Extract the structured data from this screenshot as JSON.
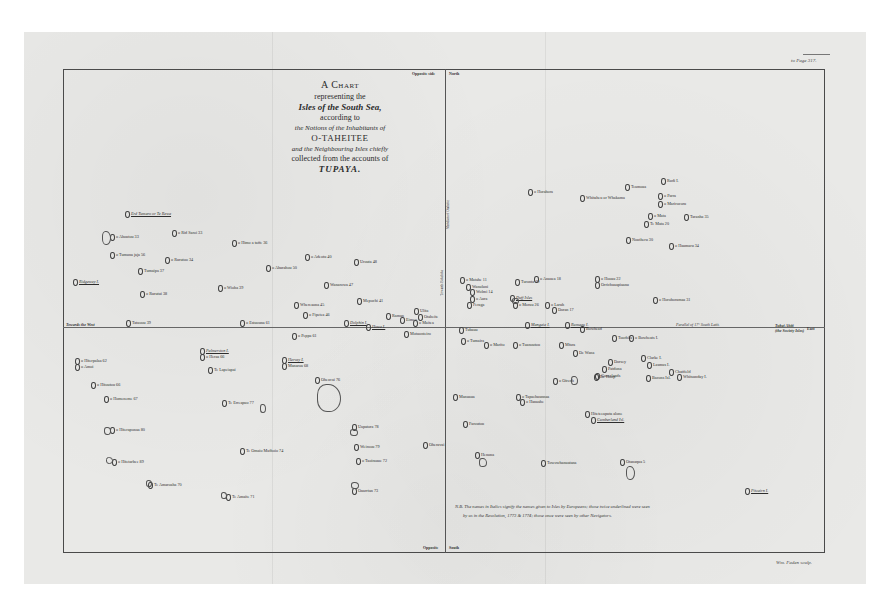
{
  "title": {
    "line1": "A Chart",
    "line2": "representing the",
    "line3": "Isles of the South Sea,",
    "line4": "according to",
    "line5": "the Notions of the Inhabitants of",
    "line6": "O-TAHEITEE",
    "line7": "and the Neighbouring Isles chiefly",
    "line8": "collected from the accounts of",
    "line9": "TUPAYA."
  },
  "margins": {
    "page_ref": "to Page 317.",
    "top_left": "Opposite side",
    "top_right": "North",
    "bottom_left": "Opposite",
    "bottom_right": "South",
    "west_edge": "Towards the West",
    "east_edge_1": "Tubai Ahiti",
    "east_edge_2": "(the Society Isles)",
    "east_suffix": "East",
    "engraver": "Wm. Faden sculp."
  },
  "lines": {
    "meridian_note": "Meridian of Otaheite",
    "meridian_note_lower": "Towards Bolabola",
    "parallel_note": "Parallel of 17° South Latit."
  },
  "footnote": {
    "line1": "N.B. The names in Italics signify the names given to Isles by Europeans; those twice underlined were seen",
    "line2": "by us in the Resolution, 1773 & 1774; those once were seen by other Navigators."
  },
  "islands": [
    {
      "name": "Erd Tumaro or Te Rewa",
      "x": 125,
      "y": 211,
      "italic": true
    },
    {
      "name": "o Ahoutou 33",
      "x": 110,
      "y": 234
    },
    {
      "name": "o Rid Saroi 33",
      "x": 172,
      "y": 230
    },
    {
      "name": "o Himo a taffe 36",
      "x": 232,
      "y": 240
    },
    {
      "name": "o Tumuna jaja 56",
      "x": 110,
      "y": 252
    },
    {
      "name": "o Rurutoo 34",
      "x": 165,
      "y": 257
    },
    {
      "name": "Tumaipa 37",
      "x": 138,
      "y": 268
    },
    {
      "name": "Ridgeway I.",
      "x": 73,
      "y": 279,
      "italic": true
    },
    {
      "name": "o Rurutui 38",
      "x": 140,
      "y": 291
    },
    {
      "name": "o Wioha 39",
      "x": 218,
      "y": 285
    },
    {
      "name": "o Adeotu 40",
      "x": 305,
      "y": 254
    },
    {
      "name": "Urouta 48",
      "x": 354,
      "y": 259
    },
    {
      "name": "o Ahurahou 50",
      "x": 266,
      "y": 265
    },
    {
      "name": "Wanarowa 47",
      "x": 324,
      "y": 282
    },
    {
      "name": "Whereaona 45",
      "x": 294,
      "y": 302
    },
    {
      "name": "o Fipetea 46",
      "x": 303,
      "y": 312
    },
    {
      "name": "Mepochi 41",
      "x": 357,
      "y": 298
    },
    {
      "name": "Tatuoou 39",
      "x": 126,
      "y": 320
    },
    {
      "name": "o Estuouna 61",
      "x": 240,
      "y": 320
    },
    {
      "name": "Dolphin I.",
      "x": 344,
      "y": 320,
      "italic": true
    },
    {
      "name": "Howe I.",
      "x": 366,
      "y": 324,
      "italic": true
    },
    {
      "name": "Raman",
      "x": 386,
      "y": 313
    },
    {
      "name": "Eimeo",
      "x": 400,
      "y": 317
    },
    {
      "name": "Ulita",
      "x": 414,
      "y": 308
    },
    {
      "name": "Otaheite",
      "x": 418,
      "y": 314
    },
    {
      "name": "o Maitea",
      "x": 413,
      "y": 320
    },
    {
      "name": "o Peppa 61",
      "x": 292,
      "y": 333
    },
    {
      "name": "Motuonteiro",
      "x": 404,
      "y": 331
    },
    {
      "name": "o Matahe 11",
      "x": 460,
      "y": 277
    },
    {
      "name": "Wanuluni",
      "x": 466,
      "y": 284
    },
    {
      "name": "Wolmi 14",
      "x": 470,
      "y": 289
    },
    {
      "name": "Turonta 19",
      "x": 515,
      "y": 279
    },
    {
      "name": "o Anauea 18",
      "x": 534,
      "y": 276
    },
    {
      "name": "o Aura",
      "x": 470,
      "y": 296
    },
    {
      "name": "Feraga",
      "x": 467,
      "y": 302
    },
    {
      "name": "Duff Isles",
      "x": 510,
      "y": 295,
      "italic": true
    },
    {
      "name": "o Moruu 26",
      "x": 513,
      "y": 302
    },
    {
      "name": "o Laruh",
      "x": 545,
      "y": 302
    },
    {
      "name": "Doran 17",
      "x": 552,
      "y": 307
    },
    {
      "name": "Tubauu",
      "x": 459,
      "y": 327
    },
    {
      "name": "Mangaia I.",
      "x": 525,
      "y": 322,
      "italic": true
    },
    {
      "name": "Rumaau I.",
      "x": 565,
      "y": 322,
      "italic": true
    },
    {
      "name": "o Tumaira",
      "x": 461,
      "y": 338
    },
    {
      "name": "o Marito",
      "x": 484,
      "y": 342
    },
    {
      "name": "o Tuanoutou",
      "x": 513,
      "y": 342
    },
    {
      "name": "Mfara",
      "x": 559,
      "y": 342
    },
    {
      "name": "De Wana",
      "x": 573,
      "y": 350
    },
    {
      "name": "o Oirenh",
      "x": 553,
      "y": 378
    },
    {
      "name": "De Hoop",
      "x": 594,
      "y": 374
    },
    {
      "name": "o Horahora",
      "x": 528,
      "y": 189
    },
    {
      "name": "Whitaheu or Whakama",
      "x": 580,
      "y": 195
    },
    {
      "name": "Teamoaa",
      "x": 625,
      "y": 184
    },
    {
      "name": "Rudi I.",
      "x": 661,
      "y": 178
    },
    {
      "name": "o Parra",
      "x": 658,
      "y": 193
    },
    {
      "name": "o Marirocoru",
      "x": 658,
      "y": 201
    },
    {
      "name": "o Mata",
      "x": 648,
      "y": 213
    },
    {
      "name": "Te Mata 20",
      "x": 644,
      "y": 221
    },
    {
      "name": "Taranha 35",
      "x": 684,
      "y": 214
    },
    {
      "name": "Noutheru 30",
      "x": 626,
      "y": 237
    },
    {
      "name": "o Haumaru 34",
      "x": 669,
      "y": 243
    },
    {
      "name": "o Hooau 22",
      "x": 595,
      "y": 276
    },
    {
      "name": "Orrichuaapiaanu",
      "x": 595,
      "y": 282
    },
    {
      "name": "o Horohoramaa 31",
      "x": 653,
      "y": 297
    },
    {
      "name": "Bowhead",
      "x": 580,
      "y": 326
    },
    {
      "name": "o Bowheats I.",
      "x": 629,
      "y": 335
    },
    {
      "name": "Toorhila",
      "x": 612,
      "y": 335
    },
    {
      "name": "Dorsey",
      "x": 608,
      "y": 359
    },
    {
      "name": "Patdona",
      "x": 602,
      "y": 366
    },
    {
      "name": "Clarke I.",
      "x": 641,
      "y": 355
    },
    {
      "name": "Gonerlands",
      "x": 595,
      "y": 373
    },
    {
      "name": "Lasmus I.",
      "x": 647,
      "y": 362
    },
    {
      "name": "Chatfield",
      "x": 669,
      "y": 369
    },
    {
      "name": "Bacons Isl.",
      "x": 646,
      "y": 375
    },
    {
      "name": "Whitsunday I.",
      "x": 677,
      "y": 374
    },
    {
      "name": "o Hiterpalaa 62",
      "x": 75,
      "y": 358
    },
    {
      "name": "o Amoi",
      "x": 75,
      "y": 364
    },
    {
      "name": "o Hitoutou 66",
      "x": 91,
      "y": 382
    },
    {
      "name": "o Homeneme 67",
      "x": 104,
      "y": 396
    },
    {
      "name": "Palmerston I.",
      "x": 200,
      "y": 348,
      "italic": true
    },
    {
      "name": "o Heraa 66",
      "x": 200,
      "y": 354
    },
    {
      "name": "Te Lapeiapai",
      "x": 208,
      "y": 367
    },
    {
      "name": "Hervey I.",
      "x": 282,
      "y": 357,
      "italic": true
    },
    {
      "name": "Manaroa 68",
      "x": 282,
      "y": 363
    },
    {
      "name": "Oheavai 76",
      "x": 315,
      "y": 377
    },
    {
      "name": "Te Erreapuo 77",
      "x": 222,
      "y": 400
    },
    {
      "name": "o Hiteraponaa 80",
      "x": 110,
      "y": 427
    },
    {
      "name": "Te Omaio Mafhoio 74",
      "x": 240,
      "y": 448
    },
    {
      "name": "o Hitetarbee 89",
      "x": 112,
      "y": 459
    },
    {
      "name": "Te Amaroaha 70",
      "x": 148,
      "y": 482
    },
    {
      "name": "Te Amaite 71",
      "x": 226,
      "y": 494
    },
    {
      "name": "Uapatora 78",
      "x": 352,
      "y": 424
    },
    {
      "name": "Weiroou 79",
      "x": 354,
      "y": 444
    },
    {
      "name": "o Taoirauue 72",
      "x": 356,
      "y": 458
    },
    {
      "name": "Ouarrtan 73",
      "x": 352,
      "y": 488
    },
    {
      "name": "Oheravai",
      "x": 423,
      "y": 442
    },
    {
      "name": "Manuaua",
      "x": 453,
      "y": 394
    },
    {
      "name": "Faroutou",
      "x": 463,
      "y": 421
    },
    {
      "name": "Henona",
      "x": 475,
      "y": 452
    },
    {
      "name": "o Tapaehuunnaa",
      "x": 516,
      "y": 394
    },
    {
      "name": "o Hanaahe",
      "x": 520,
      "y": 399
    },
    {
      "name": "Hiteteeaputa alone",
      "x": 585,
      "y": 411
    },
    {
      "name": "Cumberland Isl.",
      "x": 591,
      "y": 417,
      "italic": true
    },
    {
      "name": "Towowhanuatana",
      "x": 541,
      "y": 460
    },
    {
      "name": "Otanaqua 5",
      "x": 620,
      "y": 459
    },
    {
      "name": "Pitcairn I.",
      "x": 745,
      "y": 488,
      "italic": true
    }
  ],
  "shapes": [
    {
      "label": "o Ahoutou",
      "x": 102,
      "y": 231,
      "w": 7,
      "h": 12
    },
    {
      "label": "Oheavai",
      "x": 317,
      "y": 384,
      "w": 22,
      "h": 26
    },
    {
      "label": "Otanaqua",
      "x": 626,
      "y": 466,
      "w": 7,
      "h": 12
    },
    {
      "label": "Henona",
      "x": 479,
      "y": 458,
      "w": 6,
      "h": 7
    },
    {
      "label": "Uapatora",
      "x": 350,
      "y": 429,
      "w": 6,
      "h": 5
    },
    {
      "label": "Ouarrtan",
      "x": 351,
      "y": 482,
      "w": 6,
      "h": 5
    },
    {
      "label": "o Hiteraponaa",
      "x": 104,
      "y": 427,
      "w": 5,
      "h": 6
    },
    {
      "label": "o Hitetarbee",
      "x": 106,
      "y": 457,
      "w": 5,
      "h": 5
    },
    {
      "label": "Te Amaite",
      "x": 221,
      "y": 492,
      "w": 4,
      "h": 5
    },
    {
      "label": "Te Amaroaha",
      "x": 146,
      "y": 480,
      "w": 4,
      "h": 5
    },
    {
      "label": "Te Erreapuo",
      "x": 260,
      "y": 404,
      "w": 4,
      "h": 7
    },
    {
      "label": "Cook Isles",
      "x": 512,
      "y": 298,
      "w": 5,
      "h": 4
    },
    {
      "label": "Oirenh",
      "x": 571,
      "y": 376,
      "w": 5,
      "h": 7
    }
  ]
}
